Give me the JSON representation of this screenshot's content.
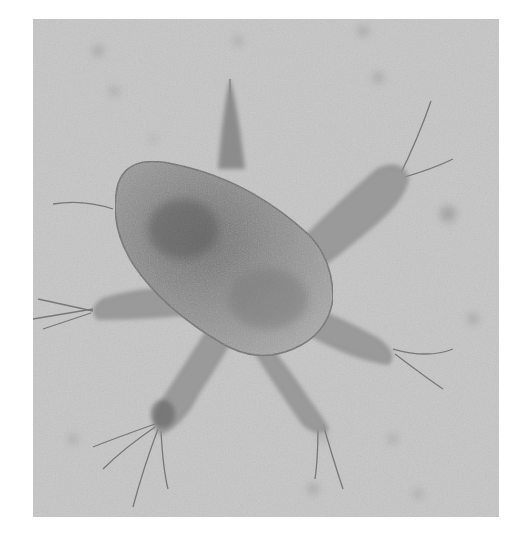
{
  "image": {
    "subject": "microscope photograph of a nauplius larva",
    "colors": {
      "background": "#c4c4c4",
      "body": "#8f8f8f",
      "body_dark": "#5e5e5e",
      "limbs": "#9e9e9e",
      "setae": "#6a6a6a",
      "page": "#ffffff"
    }
  }
}
